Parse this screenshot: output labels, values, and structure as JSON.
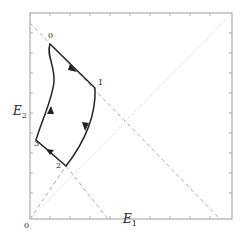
{
  "diagram": {
    "axes": {
      "x_label": "E",
      "x_label_sub": "1",
      "y_label": "E",
      "y_label_sub": "2",
      "origin_label": "0"
    },
    "points": [
      {
        "id": "0",
        "label": "0"
      },
      {
        "id": "1",
        "label": "1"
      },
      {
        "id": "2",
        "label": "2"
      },
      {
        "id": "3",
        "label": "3"
      }
    ],
    "colors": {
      "frame": "#999999",
      "curve": "#222222",
      "dashed": "#aaaaaa",
      "dotted": "#bbbbbb"
    }
  }
}
